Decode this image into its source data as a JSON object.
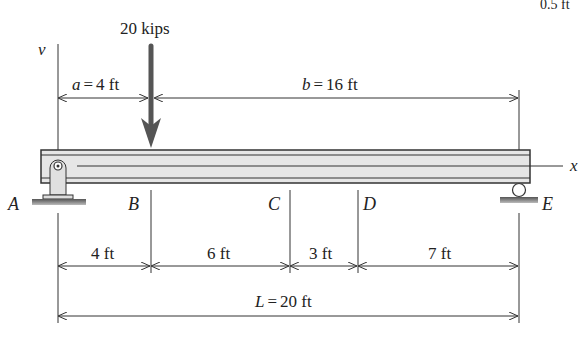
{
  "header": {
    "clipped_corner_text": "0.5 ft"
  },
  "load": {
    "label": "20 kips",
    "color": "#555555"
  },
  "axes": {
    "vertical": "v",
    "horizontal": "x"
  },
  "dimensions_top": {
    "a": {
      "var": "a",
      "eq": "=",
      "value": "4 ft"
    },
    "b": {
      "var": "b",
      "eq": "=",
      "value": "16 ft"
    }
  },
  "points": [
    "A",
    "B",
    "C",
    "D",
    "E"
  ],
  "segments": [
    "4 ft",
    "6 ft",
    "3 ft",
    "7 ft"
  ],
  "total": {
    "var": "L",
    "eq": "=",
    "value": "20 ft"
  },
  "colors": {
    "beam_fill": "#e6e6e6",
    "beam_stroke": "#333333",
    "line": "#333333"
  }
}
